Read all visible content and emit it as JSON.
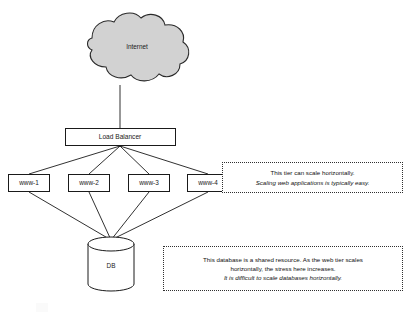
{
  "diagram": {
    "nodes": {
      "internet": {
        "label": "Internet",
        "shape": "cloud",
        "fill": "#d2d2d2"
      },
      "load_balancer": {
        "label": "Load Balancer",
        "shape": "rectangle",
        "fill": "#ffffff"
      },
      "database": {
        "label": "DB",
        "shape": "cylinder",
        "fill": "#ffffff"
      }
    },
    "web_tier": {
      "servers": [
        {
          "label": "www-1"
        },
        {
          "label": "www-2"
        },
        {
          "label": "www-3"
        },
        {
          "label": "www-4"
        }
      ]
    },
    "notes": {
      "web_tier_note": {
        "lines": [
          {
            "text": "This tier can scale horizontally.",
            "italic": false
          },
          {
            "text": "Scaling web applications is typically easy.",
            "italic": true
          }
        ]
      },
      "database_note": {
        "lines": [
          {
            "text": "This database is a shared resource.  As the web tier scales",
            "italic": false
          },
          {
            "text": "horizontally, the stress here increases.",
            "italic": false
          },
          {
            "text": "It is difficult to scale databases horizontally.",
            "italic": true
          }
        ]
      }
    },
    "colors": {
      "stroke": "#1a1a1a",
      "cloud_fill": "#d2d2d2",
      "box_fill": "#ffffff",
      "note_border": "#303030",
      "background": "#ffffff"
    }
  }
}
